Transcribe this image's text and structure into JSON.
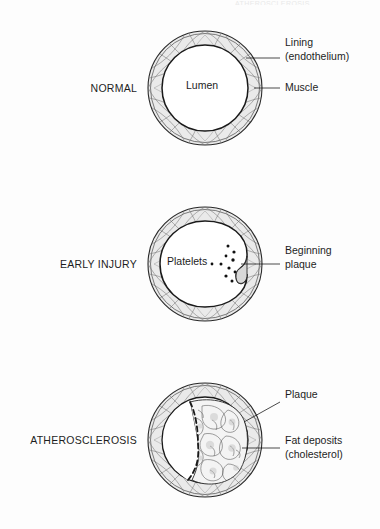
{
  "figure": {
    "running_head": "ATHEROSCLEROSIS",
    "background_color": "#fdfdfd",
    "ink_color": "#1d1d1d",
    "wall_fill": "#e8e8e8",
    "plaque_fill": "#f2f2f2"
  },
  "panels": [
    {
      "id": "normal",
      "stage_label": "NORMAL",
      "inner_labels": [
        {
          "name": "lumen",
          "text": "Lumen"
        }
      ],
      "callouts": [
        {
          "name": "lining",
          "text": "Lining\n(endothelium)"
        },
        {
          "name": "muscle",
          "text": "Muscle"
        }
      ]
    },
    {
      "id": "early-injury",
      "stage_label": "EARLY INJURY",
      "inner_labels": [
        {
          "name": "platelets",
          "text": "Platelets"
        }
      ],
      "callouts": [
        {
          "name": "beginning-plaque",
          "text": "Beginning\nplaque"
        }
      ]
    },
    {
      "id": "atherosclerosis",
      "stage_label": "ATHEROSCLEROSIS",
      "inner_labels": [],
      "callouts": [
        {
          "name": "plaque",
          "text": "Plaque"
        },
        {
          "name": "fat-deposits",
          "text": "Fat deposits\n(cholesterol)"
        }
      ]
    }
  ]
}
